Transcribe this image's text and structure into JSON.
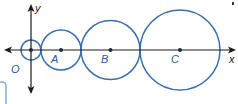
{
  "colors": {
    "circle": "#3a6fb0",
    "axis": "#1a1a1a",
    "label": "#2b5a9a",
    "fragment": "#7fb3dc"
  },
  "axes": {
    "x_label": "x",
    "y_label": "y",
    "origin_label": "O"
  },
  "circles": [
    {
      "label": "O",
      "cx": 31,
      "cy": 50,
      "r": 10
    },
    {
      "label": "A",
      "cx": 61,
      "cy": 50,
      "r": 20
    },
    {
      "label": "B",
      "cx": 110,
      "cy": 50,
      "r": 29.5
    },
    {
      "label": "C",
      "cx": 180,
      "cy": 50,
      "r": 40
    }
  ],
  "points": [
    {
      "label": "O",
      "x": 31,
      "y": 50
    },
    {
      "label": "A",
      "x": 61,
      "y": 50
    },
    {
      "label": "B",
      "x": 110,
      "y": 50
    },
    {
      "label": "C",
      "x": 180,
      "y": 50
    }
  ]
}
